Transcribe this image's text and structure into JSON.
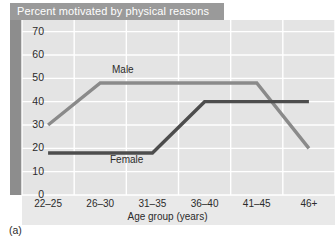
{
  "figure": {
    "caption": "(a)",
    "title": "Percent motivated by physical reasons"
  },
  "colors": {
    "title_banner_bg": "#9a9a9a",
    "title_banner_text": "#ffffff",
    "left_band": "#8d8d8d",
    "plot_bg": "#e4e4e4",
    "axis_strip_bg": "#e9e9e9",
    "gridline": "#ffffff",
    "male_line": "#8a8a8a",
    "female_line": "#4d4d4d",
    "tick_text": "#2b2b2b"
  },
  "chart_data": {
    "type": "line",
    "title": "Percent motivated by physical reasons",
    "xlabel": "Age group (years)",
    "ylabel": "",
    "categories": [
      "22–25",
      "26–30",
      "31–35",
      "36–40",
      "41–45",
      "46+"
    ],
    "yticks": [
      0,
      10,
      20,
      30,
      40,
      50,
      60,
      70
    ],
    "ylim": [
      0,
      75
    ],
    "grid": true,
    "legend": "inline-labels",
    "series": [
      {
        "name": "Male",
        "values": [
          30,
          48,
          48,
          48,
          48,
          20
        ],
        "color": "#8a8a8a"
      },
      {
        "name": "Female",
        "values": [
          18,
          18,
          18,
          40,
          40,
          40
        ],
        "color": "#4d4d4d"
      }
    ],
    "annotations": [
      {
        "text": "Male",
        "near_category": "31–35"
      },
      {
        "text": "Female",
        "near_category": "31–35"
      }
    ]
  }
}
